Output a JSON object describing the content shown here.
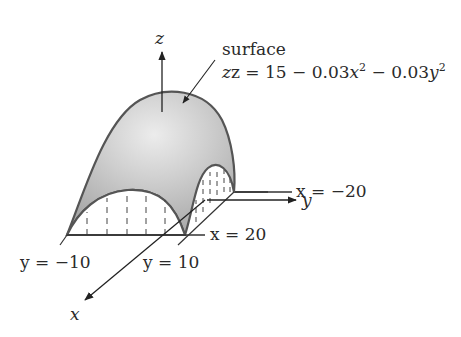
{
  "figure": {
    "type": "3d-surface-diagram",
    "surface": {
      "label": "surface",
      "equation_prefix": "z = 15 − 0.03",
      "equation_x": "x",
      "equation_mid": " − 0.03",
      "equation_y": "y",
      "exponent": "2"
    },
    "axes": {
      "z": "z",
      "y": "y",
      "x": "x"
    },
    "boundaries": {
      "x_neg": "x = −20",
      "x_pos": "x = 20",
      "y_neg": "y = −10",
      "y_pos": "y = 10"
    },
    "colors": {
      "surface_fill": "#b8b8b8",
      "surface_highlight": "#e6e6e6",
      "outline": "#555555",
      "line": "#333333",
      "background": "#ffffff"
    }
  }
}
